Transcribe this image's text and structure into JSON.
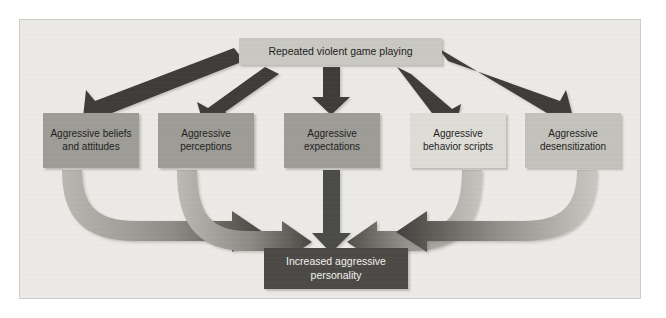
{
  "figure": {
    "background_color": "#eceae6",
    "frame_border_color": "#cfcdc9",
    "source_node": {
      "label": "Repeated violent game playing",
      "fill_color": "#c9c7c1",
      "text_color": "#1b1b1b"
    },
    "mediator_nodes": [
      {
        "id": "beliefs",
        "label": "Aggressive beliefs\nand attitudes",
        "fill_color": "#9d9b96",
        "text_color": "#1b1b1b"
      },
      {
        "id": "perceptions",
        "label": "Aggressive\nperceptions",
        "fill_color": "#9d9b96",
        "text_color": "#1b1b1b"
      },
      {
        "id": "expectations",
        "label": "Aggressive\nexpectations",
        "fill_color": "#9d9b96",
        "text_color": "#1b1b1b"
      },
      {
        "id": "scripts",
        "label": "Aggressive\nbehavior scripts",
        "fill_color": "#dedcd7",
        "text_color": "#1b1b1b"
      },
      {
        "id": "desensitization",
        "label": "Aggressive\ndesensitization",
        "fill_color": "#c3c1bc",
        "text_color": "#1b1b1b"
      }
    ],
    "outcome_node": {
      "label": "Increased aggressive\npersonality",
      "fill_color": "#4a4845",
      "text_color": "#f2f1ee"
    },
    "arrows": {
      "top_arrow_color": "#3c3a37",
      "curved_arrow_gradient_light": "#b9b7b2",
      "curved_arrow_gradient_dark": "#46443f",
      "top_count": 5,
      "bottom_count": 5
    }
  }
}
